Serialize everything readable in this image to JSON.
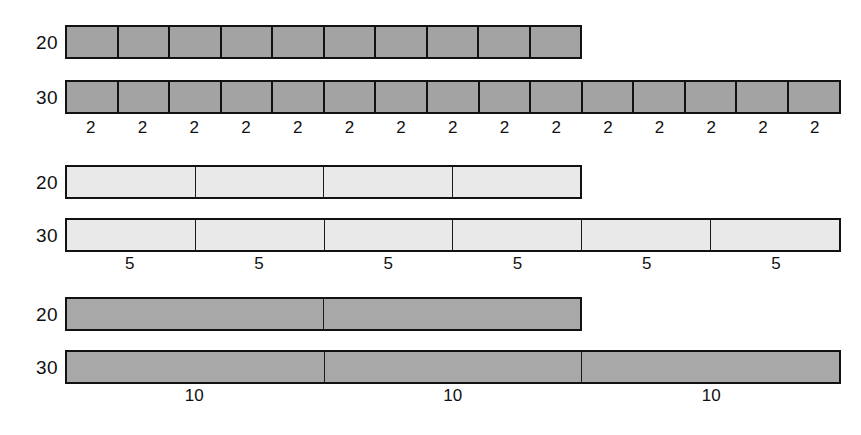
{
  "figure": {
    "title": "",
    "bar_left_px": 65,
    "unit_px": 25.85,
    "colors": {
      "fill_dark": "#a3a3a3",
      "fill_light": "#e9e9e9",
      "fill_mid": "#a8a8a8",
      "outline": "#121212",
      "text": "#101010",
      "background": "#ffffff"
    }
  },
  "chart_data": {
    "type": "bar",
    "orientation": "horizontal",
    "title": "",
    "xlabel": "",
    "ylabel": "",
    "grid": false,
    "legend": null,
    "xlim": [
      0,
      30
    ],
    "categories": [
      "20",
      "30"
    ],
    "groups": [
      {
        "name": "unit-2",
        "unit": 2,
        "unit_label": "2",
        "fill": "#a3a3a3",
        "style": "dark",
        "bars": [
          {
            "label": "20",
            "value": 20,
            "segments": 10
          },
          {
            "label": "30",
            "value": 30,
            "segments": 15
          }
        ],
        "captions": [
          "2",
          "2",
          "2",
          "2",
          "2",
          "2",
          "2",
          "2",
          "2",
          "2",
          "2",
          "2",
          "2",
          "2",
          "2"
        ]
      },
      {
        "name": "unit-5",
        "unit": 5,
        "unit_label": "5",
        "fill": "#e9e9e9",
        "style": "light",
        "bars": [
          {
            "label": "20",
            "value": 20,
            "segments": 4
          },
          {
            "label": "30",
            "value": 30,
            "segments": 6
          }
        ],
        "captions": [
          "5",
          "5",
          "5",
          "5",
          "5",
          "5"
        ]
      },
      {
        "name": "unit-10",
        "unit": 10,
        "unit_label": "10",
        "fill": "#a8a8a8",
        "style": "mid",
        "bars": [
          {
            "label": "20",
            "value": 20,
            "segments": 2
          },
          {
            "label": "30",
            "value": 30,
            "segments": 3
          }
        ],
        "captions": [
          "10",
          "10",
          "10"
        ]
      }
    ]
  }
}
